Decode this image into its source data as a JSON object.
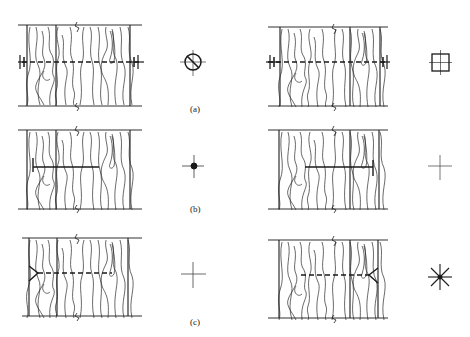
{
  "figure": {
    "rows": [
      {
        "label": "(a)",
        "label_pos": [
          197,
          108
        ],
        "left_panel": {
          "y_top": 25,
          "y_bot": 106,
          "x_left": 22,
          "x_right": 142,
          "x_mid1": 56,
          "x_split": 77,
          "connector_y": 62,
          "connector": "bolt-through",
          "symbol": "circle-slash"
        },
        "right_panel": {
          "y_top": 27,
          "y_bot": 106,
          "x_left": 280,
          "x_right": 380,
          "x_mid1": 280,
          "x_split": 350,
          "connector_y": 62,
          "connector": "bolt-through",
          "symbol": "square-cross"
        }
      },
      {
        "label": "(b)",
        "label_pos": [
          197,
          205
        ],
        "left_panel": {
          "y_top": 130,
          "y_bot": 209,
          "x_left": 22,
          "x_right": 142,
          "x_split": 77,
          "connector_y": 167,
          "connector": "nail-left",
          "symbol": "dot-cross"
        },
        "right_panel": {
          "y_top": 130,
          "y_bot": 209,
          "x_left": 280,
          "x_right": 380,
          "x_split": 350,
          "connector_y": 167,
          "connector": "nail-right",
          "symbol": "plain-cross"
        }
      },
      {
        "label": "(c)",
        "label_pos": [
          197,
          320
        ],
        "left_panel": {
          "y_top": 238,
          "y_bot": 316,
          "x_left": 22,
          "x_right": 142,
          "x_split": 77,
          "connector_y": 273,
          "connector": "screw-left",
          "symbol": "plain-cross"
        },
        "right_panel": {
          "y_top": 240,
          "y_bot": 318,
          "x_left": 280,
          "x_right": 380,
          "x_split": 350,
          "connector_y": 275,
          "connector": "screw-right",
          "symbol": "asterisk"
        }
      }
    ],
    "labels": {
      "a": "(a)",
      "b": "(b)",
      "c": "(c)"
    },
    "symbols": {
      "a_left": "circle-slash-icon",
      "a_right": "square-cross-icon",
      "b_left": "dot-cross-icon",
      "b_right": "plain-cross-icon",
      "c_left": "plain-cross-icon",
      "c_right": "asterisk-icon"
    },
    "colors": {
      "line": "#1a1a1a",
      "grain": "#2a2a2a",
      "background": "#ffffff"
    }
  }
}
